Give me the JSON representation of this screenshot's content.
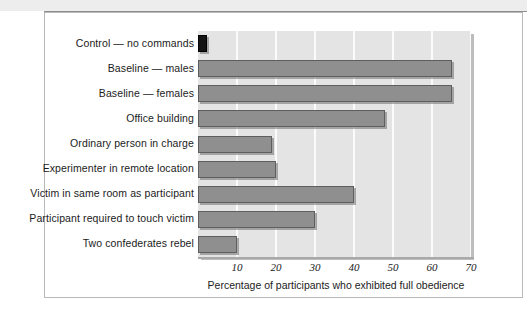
{
  "figure": {
    "background_color": "#ffffff",
    "frame_border_color": "#b9b9b9"
  },
  "chart_data": {
    "type": "bar",
    "orientation": "horizontal",
    "title": "",
    "subtitle": "",
    "xlabel": "Percentage of participants who exhibited full obedience",
    "ylabel": "",
    "xlim": [
      0,
      70
    ],
    "xticks": [
      10,
      20,
      30,
      40,
      50,
      60,
      70
    ],
    "xtick_labels": [
      "10",
      "20",
      "30",
      "40",
      "50",
      "60",
      "70"
    ],
    "grid": "vertical-white-gridlines",
    "legend": "none",
    "plot_background_color": "#e4e4e4",
    "gridline_color": "#fbfbfb",
    "bar_color": "#8f8f8f",
    "bar_edge_color": "#5e5e5e",
    "highlight_bar_color": "#141414",
    "categories": [
      "Control — no commands",
      "Baseline — males",
      "Baseline — females",
      "Office building",
      "Ordinary person in charge",
      "Experimenter in remote location",
      "Victim in same room as participant",
      "Participant required to touch victim",
      "Two confederates rebel"
    ],
    "values": [
      2,
      65,
      65,
      48,
      19,
      20,
      40,
      30,
      10
    ],
    "bars": [
      {
        "label": "Control — no commands",
        "value": 2,
        "color": "#141414"
      },
      {
        "label": "Baseline — males",
        "value": 65,
        "color": "#8f8f8f"
      },
      {
        "label": "Baseline — females",
        "value": 65,
        "color": "#8f8f8f"
      },
      {
        "label": "Office building",
        "value": 48,
        "color": "#8f8f8f"
      },
      {
        "label": "Ordinary person in charge",
        "value": 19,
        "color": "#8f8f8f"
      },
      {
        "label": "Experimenter in remote location",
        "value": 20,
        "color": "#8f8f8f"
      },
      {
        "label": "Victim in same room as participant",
        "value": 40,
        "color": "#8f8f8f"
      },
      {
        "label": "Participant required to touch victim",
        "value": 30,
        "color": "#8f8f8f"
      },
      {
        "label": "Two confederates rebel",
        "value": 10,
        "color": "#8f8f8f"
      }
    ]
  }
}
